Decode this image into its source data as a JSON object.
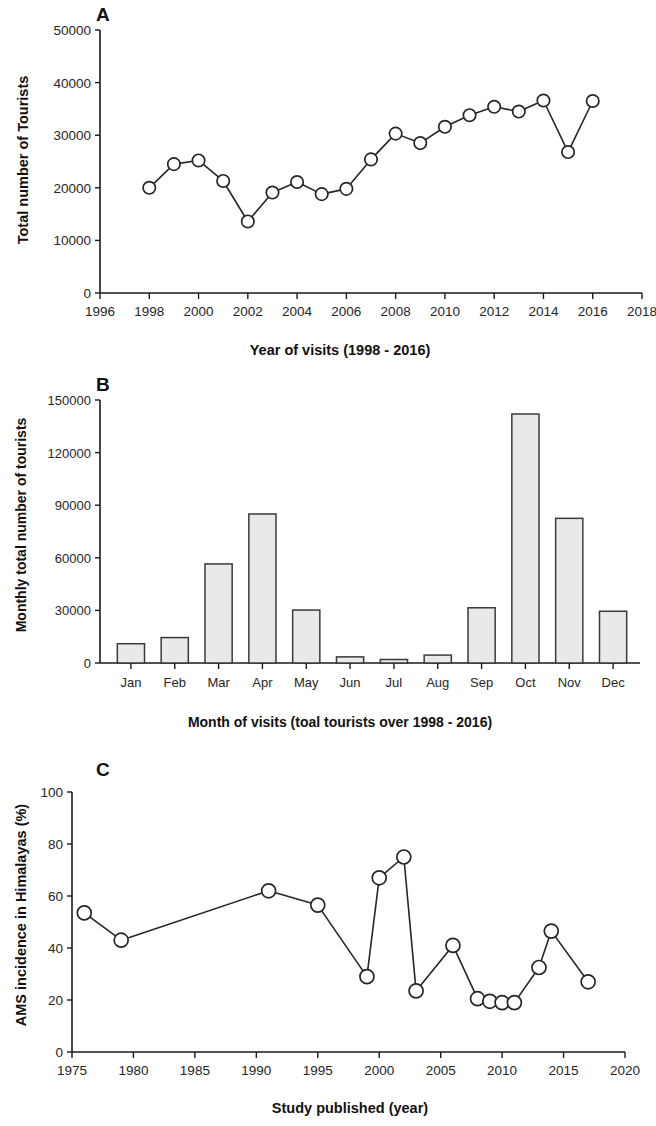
{
  "figure": {
    "panels": [
      "A",
      "B",
      "C"
    ]
  },
  "panel_a": {
    "letter": "A",
    "ylabel": "Total number of Tourists",
    "xlabel": "Year of visits (1998 - 2016)"
  },
  "panel_b": {
    "letter": "B",
    "ylabel": "Monthly total number of tourists",
    "xlabel": "Month of visits (toal tourists over 1998 - 2016)"
  },
  "panel_c": {
    "letter": "C",
    "ylabel": "AMS incidence in Himalayas (%)",
    "xlabel": "Study published (year)"
  },
  "chart_data": [
    {
      "type": "line",
      "panel": "A",
      "title": "A",
      "xlabel": "Year of visits (1998 - 2016)",
      "ylabel": "Total number of Tourists",
      "xlim": [
        1996,
        2018
      ],
      "ylim": [
        0,
        50000
      ],
      "xticks": [
        1996,
        1998,
        2000,
        2002,
        2004,
        2006,
        2008,
        2010,
        2012,
        2014,
        2016,
        2018
      ],
      "yticks": [
        0,
        10000,
        20000,
        30000,
        40000,
        50000
      ],
      "xticklabels": [
        "1996",
        "1998",
        "2000",
        "2002",
        "2004",
        "2006",
        "2008",
        "2010",
        "2012",
        "2014",
        "2016",
        "2018"
      ],
      "yticklabels": [
        "0",
        "10000",
        "20000",
        "30000",
        "40000",
        "50000"
      ],
      "grid": false,
      "legend": "none",
      "marker": "open-circle",
      "x": [
        1998,
        1999,
        2000,
        2001,
        2002,
        2003,
        2004,
        2005,
        2006,
        2007,
        2008,
        2009,
        2010,
        2011,
        2012,
        2013,
        2014,
        2015,
        2016
      ],
      "values": [
        20000,
        24500,
        25200,
        21300,
        13600,
        19100,
        21100,
        18800,
        19800,
        25400,
        30300,
        28500,
        31600,
        33800,
        35400,
        34500,
        36600,
        26800,
        36500
      ]
    },
    {
      "type": "bar",
      "panel": "B",
      "title": "B",
      "xlabel": "Month of visits (toal tourists over 1998 - 2016)",
      "ylabel": "Monthly total number of tourists",
      "ylim": [
        0,
        150000
      ],
      "yticks": [
        0,
        30000,
        60000,
        90000,
        120000,
        150000
      ],
      "yticklabels": [
        "0",
        "30000",
        "60000",
        "90000",
        "120000",
        "150000"
      ],
      "categories": [
        "Jan",
        "Feb",
        "Mar",
        "Apr",
        "May",
        "Jun",
        "Jul",
        "Aug",
        "Sep",
        "Oct",
        "Nov",
        "Dec"
      ],
      "values": [
        11000,
        14500,
        56500,
        85000,
        30200,
        3500,
        2000,
        4500,
        31500,
        142000,
        82500,
        29500
      ],
      "grid": false,
      "legend": "none",
      "bar_fill": "#e9e9e9",
      "bar_stroke": "#3a3a3a"
    },
    {
      "type": "line",
      "panel": "C",
      "title": "C",
      "xlabel": "Study published (year)",
      "ylabel": "AMS incidence in Himalayas (%)",
      "xlim": [
        1975,
        2020
      ],
      "ylim": [
        0,
        100
      ],
      "xticks": [
        1975,
        1980,
        1985,
        1990,
        1995,
        2000,
        2005,
        2010,
        2015,
        2020
      ],
      "yticks": [
        0,
        20,
        40,
        60,
        80,
        100
      ],
      "xticklabels": [
        "1975",
        "1980",
        "1985",
        "1990",
        "1995",
        "2000",
        "2005",
        "2010",
        "2015",
        "2020"
      ],
      "yticklabels": [
        "0",
        "20",
        "40",
        "60",
        "80",
        "100"
      ],
      "grid": false,
      "legend": "none",
      "marker": "open-circle",
      "x": [
        1976,
        1979,
        1991,
        1995,
        1999,
        2000,
        2002,
        2003,
        2006,
        2008,
        2009,
        2010,
        2011,
        2013,
        2014,
        2017
      ],
      "values": [
        53.5,
        43,
        62,
        56.5,
        29,
        67,
        75,
        23.5,
        41,
        20.5,
        19.5,
        19,
        19,
        32.5,
        46.5,
        27
      ]
    }
  ],
  "colors": {
    "axis": "#1a1a1a",
    "line": "#262626",
    "marker_fill": "#ffffff",
    "bar_fill": "#e9e9e9",
    "bar_stroke": "#3a3a3a",
    "background": "#ffffff"
  }
}
